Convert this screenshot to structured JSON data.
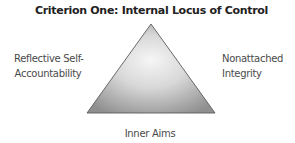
{
  "diagram": {
    "title": "Criterion One: Internal Locus of Control",
    "shape": "triangle",
    "vertices": {
      "left": {
        "lines": [
          "Reflective Self-",
          "Accountability"
        ]
      },
      "right": {
        "lines": [
          "Nonattached",
          "Integrity"
        ]
      },
      "bottom": {
        "lines": [
          "Inner Aims"
        ]
      }
    },
    "colors": {
      "triangle_light": "#f4f4f4",
      "triangle_dark": "#9a9a9a",
      "triangle_stroke": "#555555",
      "text": "#4a4a4a",
      "title": "#222222"
    }
  }
}
